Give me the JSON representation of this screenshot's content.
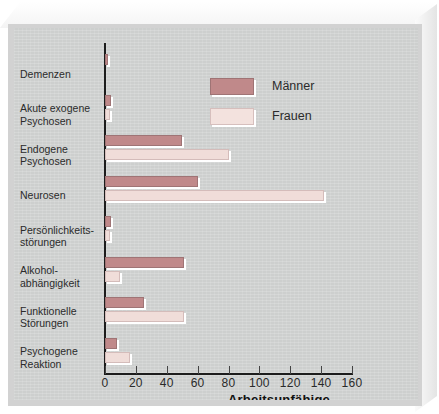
{
  "chart_data": {
    "type": "bar",
    "orientation": "horizontal",
    "title": "",
    "xlabel": "Arbeitsunfähige",
    "ylabel": "",
    "xlim": [
      0,
      160
    ],
    "xticks": [
      0,
      20,
      40,
      60,
      80,
      100,
      120,
      140,
      160
    ],
    "grid": false,
    "legend_position": "top-right",
    "categories": [
      "Demenzen",
      "Akute exogene Psychosen",
      "Endogene Psychosen",
      "Neurosen",
      "Persönlichkeits-störungen",
      "Alkohol-abhängigkeit",
      "Funktionelle Störungen",
      "Psychogene Reaktion"
    ],
    "category_lines": [
      [
        "Demenzen"
      ],
      [
        "Akute exogene",
        "Psychosen"
      ],
      [
        "Endogene",
        "Psychosen"
      ],
      [
        "Neurosen"
      ],
      [
        "Persönlichkeits-",
        "störungen"
      ],
      [
        "Alkohol-",
        "abhängigkeit"
      ],
      [
        "Funktionelle",
        "Störungen"
      ],
      [
        "Psychogene",
        "Reaktion"
      ]
    ],
    "series": [
      {
        "name": "Männer",
        "color": "#c0898a",
        "values": [
          2,
          4,
          50,
          60,
          4,
          51,
          25,
          8
        ]
      },
      {
        "name": "Frauen",
        "color": "#f0ddd9",
        "values": [
          0,
          3,
          80,
          142,
          3,
          10,
          51,
          16
        ]
      }
    ]
  },
  "legend": {
    "items": [
      {
        "label": "Männer",
        "swatch": "male"
      },
      {
        "label": "Frauen",
        "swatch": "female"
      }
    ]
  },
  "axis": {
    "x_title": "Arbeitsunfähige"
  },
  "colors": {
    "male": "#c0898a",
    "female": "#f0ddd9",
    "paper": "#cdcfce",
    "axis": "#1c1c1c"
  }
}
